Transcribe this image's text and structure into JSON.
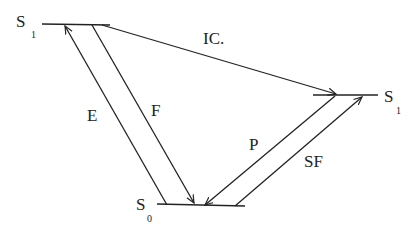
{
  "diagram": {
    "type": "jablonski-energy-level-diagram",
    "colors": {
      "ink": "#222222",
      "background": "#ffffff"
    },
    "states": {
      "s1_left": {
        "symbol": "S",
        "subscript": "1"
      },
      "s1_right": {
        "symbol": "S",
        "subscript": "1"
      },
      "s0": {
        "symbol": "S",
        "subscript": "0"
      }
    },
    "transitions": {
      "excitation": {
        "label": "E",
        "from": "S0",
        "to": "S1"
      },
      "fluorescence": {
        "label": "F",
        "from": "S1",
        "to": "S0"
      },
      "intersystem_crossing": {
        "label": "IC.",
        "from": "S1",
        "to": "S1"
      },
      "phosphorescence": {
        "label": "P",
        "from": "S1",
        "to": "S0"
      },
      "secondary": {
        "label": "SF",
        "from": "S0",
        "to": "S1"
      }
    }
  }
}
